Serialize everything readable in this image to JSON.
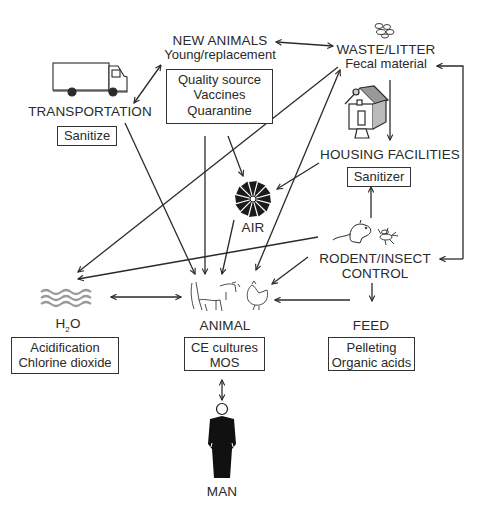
{
  "nodes": {
    "new_animals": {
      "title": "NEW ANIMALS",
      "subtitle": "Young/replacement",
      "box": [
        "Quality source",
        "Vaccines",
        "Quarantine"
      ]
    },
    "waste_litter": {
      "title": "WASTE/LITTER",
      "subtitle": "Fecal material"
    },
    "transportation": {
      "title": "TRANSPORTATION",
      "box": [
        "Sanitize"
      ]
    },
    "housing": {
      "title": "HOUSING FACILITIES",
      "box": [
        "Sanitizer"
      ]
    },
    "air": {
      "title": "AIR"
    },
    "rodent_insect": {
      "title_line1": "RODENT/INSECT",
      "title_line2": "CONTROL"
    },
    "water": {
      "title_main": "H",
      "title_sub": "2",
      "title_end": "O",
      "box": [
        "Acidification",
        "Chlorine dioxide"
      ]
    },
    "animal": {
      "title": "ANIMAL",
      "box": [
        "CE cultures",
        "MOS"
      ]
    },
    "feed": {
      "title": "FEED",
      "box": [
        "Pelleting",
        "Organic acids"
      ]
    },
    "man": {
      "title": "MAN"
    }
  },
  "icons": [
    "truck-icon",
    "feces-icon",
    "house-icon",
    "fan-icon",
    "rodent-icon",
    "insect-icon",
    "water-waves-icon",
    "cow-icon",
    "chicken-icon",
    "person-icon"
  ],
  "edges": [
    {
      "from": "new_animals",
      "to": "waste_litter",
      "type": "bidirectional"
    },
    {
      "from": "transportation",
      "to": "new_animals",
      "type": "bidirectional"
    },
    {
      "from": "waste_litter",
      "to": "housing",
      "type": "directed"
    },
    {
      "from": "rodent_insect",
      "to": "waste_litter",
      "type": "directed"
    },
    {
      "from": "rodent_insect",
      "to": "housing",
      "type": "directed"
    },
    {
      "from": "rodent_insect",
      "to": "feed",
      "type": "directed"
    },
    {
      "from": "rodent_insect",
      "to": "animal",
      "type": "directed"
    },
    {
      "from": "rodent_insect",
      "to": "water",
      "type": "directed"
    },
    {
      "from": "transportation",
      "to": "animal",
      "type": "directed"
    },
    {
      "from": "new_animals",
      "to": "animal",
      "type": "directed"
    },
    {
      "from": "new_animals",
      "to": "air",
      "type": "directed"
    },
    {
      "from": "housing",
      "to": "air",
      "type": "directed"
    },
    {
      "from": "air",
      "to": "animal",
      "type": "directed"
    },
    {
      "from": "waste_litter",
      "to": "water",
      "type": "directed"
    },
    {
      "from": "waste_litter",
      "to": "animal",
      "type": "bidirectional"
    },
    {
      "from": "feed",
      "to": "animal",
      "type": "directed"
    },
    {
      "from": "water",
      "to": "animal",
      "type": "bidirectional"
    },
    {
      "from": "animal",
      "to": "man",
      "type": "bidirectional"
    }
  ],
  "colors": {
    "ink": "#2a2a2a",
    "water": "#9a9a9a",
    "background": "#ffffff"
  }
}
